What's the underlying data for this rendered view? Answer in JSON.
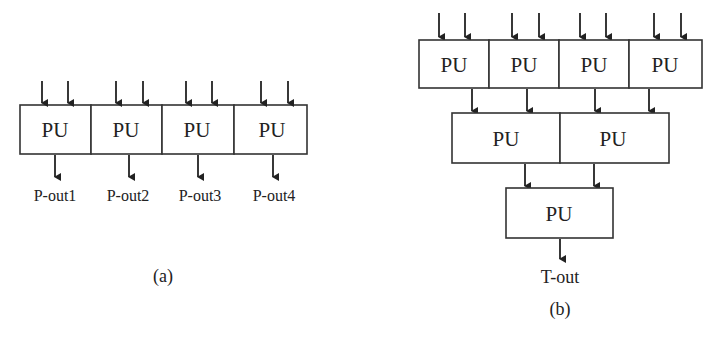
{
  "diagram_a": {
    "caption": "(a)",
    "units": [
      {
        "label": "PU",
        "output": "P-out1"
      },
      {
        "label": "PU",
        "output": "P-out2"
      },
      {
        "label": "PU",
        "output": "P-out3"
      },
      {
        "label": "PU",
        "output": "P-out4"
      }
    ]
  },
  "diagram_b": {
    "caption": "(b)",
    "level1": [
      "PU",
      "PU",
      "PU",
      "PU"
    ],
    "level2": [
      "PU",
      "PU"
    ],
    "level3": [
      "PU"
    ],
    "output": "T-out"
  }
}
